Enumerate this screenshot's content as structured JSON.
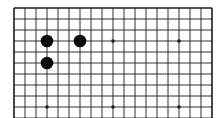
{
  "board": {
    "title": "Go board fragment",
    "columns": 19,
    "visible_rows": 11,
    "top_edge_visible": true,
    "left_edge_visible": true,
    "right_edge_visible": true,
    "bottom_edge_visible": false,
    "colors": {
      "background": "#ffffff",
      "line": "#1a1a1a",
      "black_stone": "#0a0a0a"
    },
    "star_points": [
      {
        "col": 4,
        "row": 4
      },
      {
        "col": 10,
        "row": 4
      },
      {
        "col": 16,
        "row": 4
      },
      {
        "col": 4,
        "row": 10
      },
      {
        "col": 10,
        "row": 10
      },
      {
        "col": 16,
        "row": 10
      }
    ],
    "stones": [
      {
        "color": "black",
        "col": 4,
        "row": 4
      },
      {
        "color": "black",
        "col": 7,
        "row": 4
      },
      {
        "color": "black",
        "col": 4,
        "row": 6
      }
    ]
  }
}
